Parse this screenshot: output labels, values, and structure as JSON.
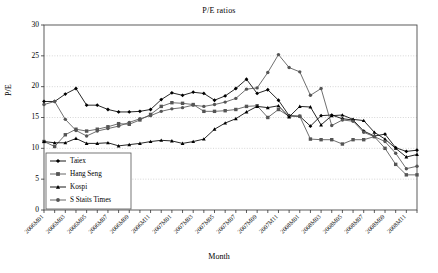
{
  "chart_data": {
    "type": "line",
    "title": "P/E ratios",
    "xlabel": "Month",
    "ylabel": "P/E",
    "ylim": [
      0,
      30
    ],
    "yticks": [
      0,
      5,
      10,
      15,
      20,
      25,
      30
    ],
    "grid": true,
    "legend_position": "lower-left-inside",
    "x": [
      "2006M01",
      "2006M02",
      "2006M03",
      "2006M04",
      "2006M05",
      "2006M06",
      "2006M07",
      "2006M08",
      "2006M09",
      "2006M10",
      "2006M11",
      "2006M12",
      "2007M01",
      "2007M02",
      "2007M03",
      "2007M04",
      "2007M05",
      "2007M06",
      "2007M07",
      "2007M08",
      "2007M09",
      "2007M10",
      "2007M11",
      "2007M12",
      "2008M01",
      "2008M02",
      "2008M03",
      "2008M04",
      "2008M05",
      "2008M06",
      "2008M07",
      "2008M08",
      "2008M09",
      "2008M10",
      "2008M11",
      "2008M12"
    ],
    "xticklabels": [
      "2006M01",
      "2006M03",
      "2006M05",
      "2006M07",
      "2006M09",
      "2006M11",
      "2007M01",
      "2007M03",
      "2007M05",
      "2007M07",
      "2007M09",
      "2007M11",
      "2008M01",
      "2008M03",
      "2008M05",
      "2008M07",
      "2008M09",
      "2008M11"
    ],
    "xtick_indices": [
      0,
      2,
      4,
      6,
      8,
      10,
      12,
      14,
      16,
      18,
      20,
      22,
      24,
      26,
      28,
      30,
      32,
      34
    ],
    "series": [
      {
        "name": "Taiex",
        "marker": "diamond",
        "color": "#000000",
        "values": [
          17.6,
          17.6,
          18.8,
          19.7,
          17.0,
          17.0,
          16.3,
          15.9,
          15.9,
          16.0,
          16.3,
          17.9,
          19.0,
          18.6,
          19.1,
          18.9,
          17.8,
          18.5,
          19.7,
          21.2,
          18.9,
          19.5,
          17.8,
          15.3,
          15.2,
          13.6,
          15.3,
          15.4,
          14.8,
          14.6,
          12.8,
          12.0,
          12.3,
          10.1,
          9.5,
          9.7
        ]
      },
      {
        "name": "Hang Seng",
        "marker": "square",
        "color": "#555555",
        "values": [
          11.1,
          10.3,
          12.2,
          13.1,
          12.8,
          13.1,
          13.5,
          14.0,
          13.9,
          14.6,
          15.5,
          16.8,
          17.4,
          17.3,
          17.1,
          16.0,
          16.0,
          16.1,
          16.3,
          16.8,
          16.9,
          15.0,
          16.3,
          15.2,
          15.2,
          11.5,
          11.4,
          11.4,
          10.7,
          11.4,
          11.4,
          11.9,
          10.0,
          7.4,
          5.7,
          5.7
        ]
      },
      {
        "name": "Kospi",
        "marker": "triangle",
        "color": "#000000",
        "values": [
          11.1,
          10.9,
          10.9,
          11.6,
          10.8,
          10.8,
          10.9,
          10.4,
          10.6,
          10.8,
          11.1,
          11.3,
          11.2,
          10.8,
          11.1,
          11.5,
          13.1,
          14.1,
          14.8,
          15.9,
          16.8,
          16.6,
          16.9,
          15.1,
          16.8,
          16.7,
          13.8,
          15.3,
          15.4,
          14.7,
          14.5,
          12.6,
          11.5,
          10.0,
          8.6,
          9.0
        ]
      },
      {
        "name": "S Staits Times",
        "marker": "circle",
        "color": "#555555",
        "values": [
          17.1,
          17.6,
          14.7,
          12.9,
          12.0,
          12.8,
          13.2,
          13.6,
          14.2,
          14.8,
          15.3,
          16.0,
          16.4,
          16.6,
          17.0,
          16.8,
          17.1,
          17.5,
          18.1,
          19.6,
          19.8,
          22.3,
          25.2,
          23.1,
          22.4,
          18.6,
          19.7,
          13.7,
          14.6,
          14.4,
          12.6,
          11.9,
          11.1,
          9.2,
          6.7,
          7.1
        ]
      }
    ]
  }
}
